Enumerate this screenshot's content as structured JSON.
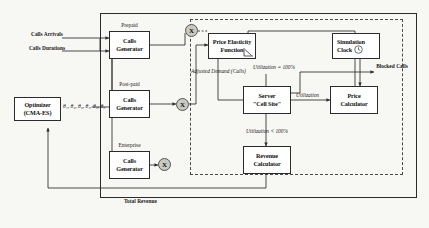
{
  "diagram": {
    "colors": {
      "background": "#f7f7f4",
      "line": "#2b2b2b",
      "dashed": "#4a4a4a",
      "node_fill": "#c9c9c4"
    }
  },
  "inputs": {
    "calls_arrivals": "Calls\nArrivals",
    "calls_arrivals_l1": "Calls",
    "calls_arrivals_l2": "Arrivals",
    "calls_durations_l1": "Calls",
    "calls_durations_l2": "Durations"
  },
  "optimizer": {
    "line1": "Optimizer",
    "line2": "(CMA-ES)",
    "parameters": "θ₁, θ₂, θ₃, θ₄, θ₅, θ₆"
  },
  "generators": [
    {
      "segment": "Prepaid",
      "line1": "Calls",
      "line2": "Generator"
    },
    {
      "segment": "Post-paid",
      "line1": "Calls",
      "line2": "Generator"
    },
    {
      "segment": "Enterprise",
      "line1": "Calls",
      "line2": "Generator"
    }
  ],
  "multiplier_nodes": [
    {
      "label": "X",
      "name": "multiplier-prepaid"
    },
    {
      "label": "X",
      "name": "multiplier-postpaid"
    },
    {
      "label": "X",
      "name": "multiplier-enterprise"
    }
  ],
  "blocks": {
    "price_elasticity": {
      "line1": "Price Elasticity",
      "line2": "Function"
    },
    "simulation_clock": {
      "line1": "Simulation",
      "line2": "Clock",
      "icon": "clock-icon"
    },
    "server": {
      "line1": "Server",
      "line2": "\"Cell Site\""
    },
    "price_calculator": {
      "line1": "Price",
      "line2": "Calculator"
    },
    "revenue_calculator": {
      "line1": "Revenue",
      "line2": "Calculator"
    }
  },
  "edge_labels": {
    "adjusted_demand_l1": "Adjusted",
    "adjusted_demand_l2": "Demand",
    "adjusted_demand_l3": "(Calls)",
    "utilization_in": "Utilization",
    "utilization_full": "Utilization = 100%",
    "utilization_partial": "Utilization < 100%",
    "blocked_calls_l1": "Blocked",
    "blocked_calls_l2": "Calls",
    "total_revenue": "Total Revenue"
  }
}
